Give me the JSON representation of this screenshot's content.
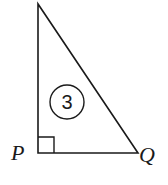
{
  "diagram": {
    "type": "right-triangle",
    "vertices": {
      "top": {
        "x": 38,
        "y": 4
      },
      "P": {
        "x": 38,
        "y": 153,
        "label": "P"
      },
      "Q": {
        "x": 138,
        "y": 153,
        "label": "Q"
      }
    },
    "right_angle_at": "P",
    "marker": {
      "label": "3",
      "shape": "circle"
    },
    "colors": {
      "stroke": "#1a1a1a",
      "background": "#ffffff"
    }
  }
}
